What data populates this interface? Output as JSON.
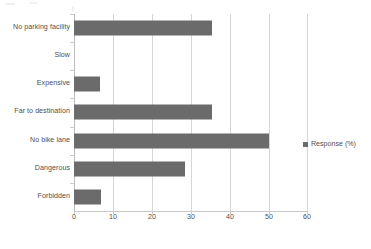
{
  "chart_data": {
    "type": "bar",
    "orientation": "horizontal",
    "title": "",
    "subtitle": "",
    "xlabel": "",
    "ylabel": "",
    "categories": [
      "No parking facility",
      "Slow",
      "Expensive",
      "Far to destination",
      "No bike lane",
      "Dangerous",
      "Forbidden"
    ],
    "values": [
      35.5,
      0,
      6.7,
      35.5,
      50,
      28.5,
      7
    ],
    "series": [
      {
        "name": "Response (%)",
        "values": [
          35.5,
          0,
          6.7,
          35.5,
          50,
          28.5,
          7
        ],
        "color": "#6b6b6b"
      }
    ],
    "xlim": [
      0,
      60
    ],
    "xticks": [
      0,
      10,
      20,
      30,
      40,
      50,
      60
    ],
    "xtick_labels": [
      "0",
      "10",
      "20",
      "30",
      "40",
      "50",
      "60"
    ],
    "grid": true,
    "grid_axis": "x",
    "legend": {
      "position": "right",
      "entries": [
        {
          "label": "Response (%)",
          "color": "#6b6b6b"
        }
      ]
    },
    "colors": {
      "bar": "#6b6b6b",
      "gridline": "#d6d6d6",
      "axis": "#c9c9c9",
      "text": "#4f4f4f",
      "background": "#ffffff"
    }
  }
}
